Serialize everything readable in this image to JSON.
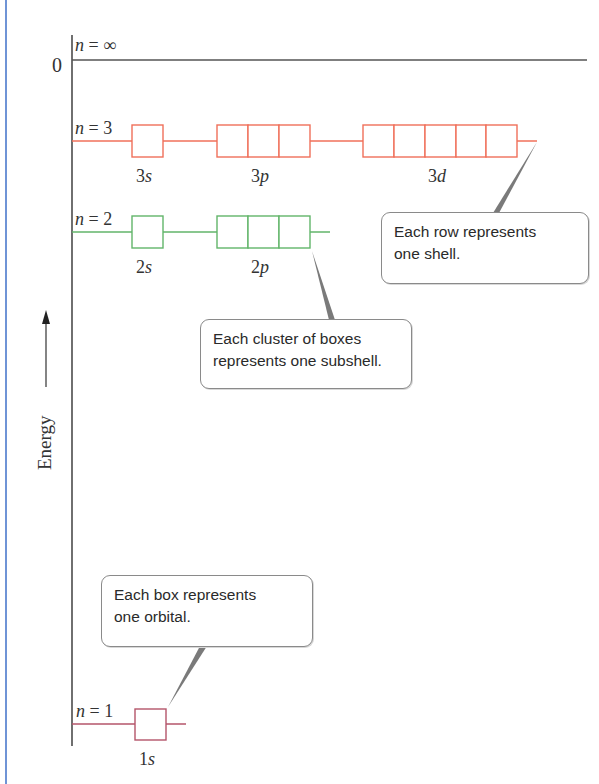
{
  "axis": {
    "zero_label": "0",
    "energy_label": "Energy",
    "arrow": "up-arrow"
  },
  "levels": {
    "inf": {
      "label_n": "n",
      "label_eq": " = ∞"
    },
    "n3": {
      "label_n": "n",
      "label_eq": " = 3",
      "color": "#f0705a",
      "subshells": [
        {
          "num": "3",
          "letter": "s",
          "boxes": 1
        },
        {
          "num": "3",
          "letter": "p",
          "boxes": 3
        },
        {
          "num": "3",
          "letter": "d",
          "boxes": 5
        }
      ]
    },
    "n2": {
      "label_n": "n",
      "label_eq": " = 2",
      "color": "#62b56a",
      "subshells": [
        {
          "num": "2",
          "letter": "s",
          "boxes": 1
        },
        {
          "num": "2",
          "letter": "p",
          "boxes": 3
        }
      ]
    },
    "n1": {
      "label_n": "n",
      "label_eq": " = 1",
      "color": "#b4556a",
      "subshells": [
        {
          "num": "1",
          "letter": "s",
          "boxes": 1
        }
      ]
    }
  },
  "callouts": {
    "shell": {
      "line1": "Each row represents",
      "line2": "one shell."
    },
    "subshell": {
      "line1": "Each cluster of boxes",
      "line2": "represents one subshell."
    },
    "orbital": {
      "line1": "Each box represents",
      "line2": "one orbital."
    }
  },
  "colors": {
    "axis": "#333333",
    "border_left": "#6f94d6",
    "pointer": "#7a7a7a"
  }
}
